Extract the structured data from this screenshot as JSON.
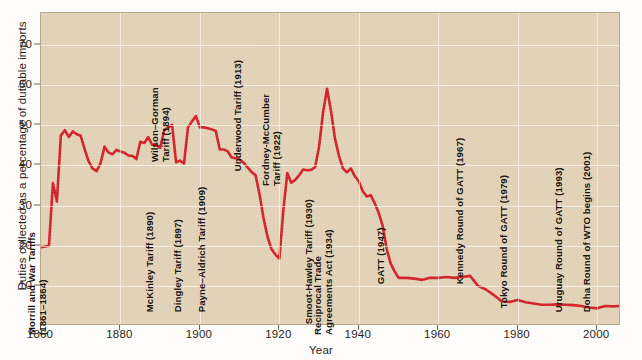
{
  "chart_data": {
    "type": "line",
    "title": "",
    "xlabel": "Year",
    "ylabel": "Duties collected as a percentage of dutiable imports",
    "xlim": [
      1860,
      2006
    ],
    "ylim": [
      0,
      78
    ],
    "grid": true,
    "legend": "none",
    "line_color": "#d3242c",
    "plot_background": "#e2d3b8",
    "yticks": [
      10,
      20,
      30,
      40,
      50,
      60,
      70
    ],
    "xticks": [
      1860,
      1880,
      1900,
      1920,
      1940,
      1960,
      1980,
      2000
    ],
    "series": [
      {
        "name": "Duties collected as a percentage of dutiable imports",
        "x": [
          1860,
          1862,
          1863,
          1864,
          1865,
          1866,
          1867,
          1868,
          1869,
          1870,
          1871,
          1872,
          1873,
          1874,
          1875,
          1876,
          1877,
          1878,
          1879,
          1880,
          1881,
          1882,
          1883,
          1884,
          1885,
          1886,
          1887,
          1888,
          1889,
          1890,
          1891,
          1892,
          1893,
          1894,
          1895,
          1896,
          1897,
          1898,
          1899,
          1900,
          1901,
          1902,
          1903,
          1904,
          1905,
          1906,
          1907,
          1908,
          1909,
          1910,
          1911,
          1912,
          1913,
          1914,
          1915,
          1916,
          1917,
          1918,
          1919,
          1920,
          1921,
          1922,
          1923,
          1924,
          1925,
          1926,
          1927,
          1928,
          1929,
          1930,
          1931,
          1932,
          1933,
          1934,
          1935,
          1936,
          1937,
          1938,
          1939,
          1940,
          1941,
          1942,
          1943,
          1944,
          1945,
          1946,
          1947,
          1948,
          1949,
          1950,
          1952,
          1954,
          1956,
          1958,
          1960,
          1962,
          1964,
          1966,
          1968,
          1970,
          1972,
          1974,
          1976,
          1978,
          1980,
          1982,
          1984,
          1986,
          1988,
          1990,
          1992,
          1994,
          1996,
          1998,
          2000,
          2002,
          2004,
          2006
        ],
        "values": [
          19.6,
          20.0,
          35.6,
          31.0,
          47.5,
          48.8,
          47.1,
          48.5,
          47.8,
          47.4,
          44.0,
          41.0,
          39.2,
          38.6,
          40.6,
          44.7,
          43.2,
          42.8,
          43.9,
          43.5,
          43.2,
          42.5,
          42.4,
          41.6,
          45.9,
          45.6,
          47.1,
          45.1,
          45.1,
          44.4,
          48.7,
          49.5,
          50.1,
          40.8,
          41.2,
          40.5,
          49.5,
          51.0,
          52.3,
          49.5,
          49.5,
          49.3,
          49.0,
          48.6,
          44.0,
          44.0,
          43.5,
          42.0,
          41.8,
          41.5,
          40.7,
          39.5,
          38.4,
          37.6,
          32.9,
          27.0,
          22.3,
          19.2,
          17.8,
          16.8,
          28.8,
          38.1,
          35.7,
          36.4,
          37.6,
          39.0,
          38.8,
          38.9,
          39.6,
          44.7,
          53.2,
          59.1,
          53.6,
          46.7,
          42.4,
          39.3,
          38.3,
          39.3,
          37.3,
          36.0,
          33.6,
          32.3,
          32.6,
          30.6,
          28.2,
          25.0,
          19.3,
          15.6,
          13.6,
          12.0,
          12.0,
          11.8,
          11.5,
          12.0,
          12.0,
          12.2,
          12.0,
          12.2,
          12.5,
          10.0,
          9.1,
          7.7,
          6.1,
          6.0,
          6.5,
          5.9,
          5.6,
          5.3,
          5.3,
          5.4,
          5.3,
          5.2,
          5.0,
          4.6,
          4.4,
          5.0,
          4.9,
          5.0
        ]
      }
    ],
    "annotations": [
      {
        "id": "morrill",
        "label_lines": [
          "Morrill and War Tariffs",
          "(1861–1864)"
        ],
        "x_year": 1862,
        "baseline_pct": 3
      },
      {
        "id": "mckinley",
        "label_lines": [
          "McKinley Tariff (1890)"
        ],
        "x_year": 1889,
        "baseline_pct": 6
      },
      {
        "id": "wilson-gorman",
        "label_lines": [
          "Wilson–Gorman",
          "Tariff (1894)"
        ],
        "x_year": 1893,
        "baseline_pct": 46
      },
      {
        "id": "dingley",
        "label_lines": [
          "Dingley Tariff (1897)"
        ],
        "x_year": 1896,
        "baseline_pct": 6
      },
      {
        "id": "payne-aldrich",
        "label_lines": [
          "Payne–Aldrich Tariff (1909)"
        ],
        "x_year": 1902,
        "baseline_pct": 6
      },
      {
        "id": "underwood",
        "label_lines": [
          "Underwood Tariff (1913)"
        ],
        "x_year": 1911,
        "baseline_pct": 41
      },
      {
        "id": "fordney",
        "label_lines": [
          "Fordney-McCumber",
          "Tariff (1922)"
        ],
        "x_year": 1921,
        "baseline_pct": 40
      },
      {
        "id": "smoot-hawley",
        "label_lines": [
          "Smoot-Hawley Tariff (1930)"
        ],
        "x_year": 1929,
        "baseline_pct": 3
      },
      {
        "id": "reciprocal",
        "label_lines": [
          "Reciprocal Trade",
          "Agreements Act (1934)"
        ],
        "x_year": 1934,
        "baseline_pct": 3
      },
      {
        "id": "gatt-1947",
        "label_lines": [
          "GATT (1947)"
        ],
        "x_year": 1947,
        "baseline_pct": 13
      },
      {
        "id": "kennedy-round",
        "label_lines": [
          "Kennedy Round of GATT (1967)"
        ],
        "x_year": 1967,
        "baseline_pct": 13
      },
      {
        "id": "tokyo-round",
        "label_lines": [
          "Tokyo Round of GATT (1979)"
        ],
        "x_year": 1978,
        "baseline_pct": 7
      },
      {
        "id": "uruguay-round",
        "label_lines": [
          "Uruguay Round of GATT (1993)"
        ],
        "x_year": 1992,
        "baseline_pct": 6
      },
      {
        "id": "doha-round",
        "label_lines": [
          "Doha Round of WTO begins (2001)"
        ],
        "x_year": 1999,
        "baseline_pct": 6
      }
    ]
  }
}
